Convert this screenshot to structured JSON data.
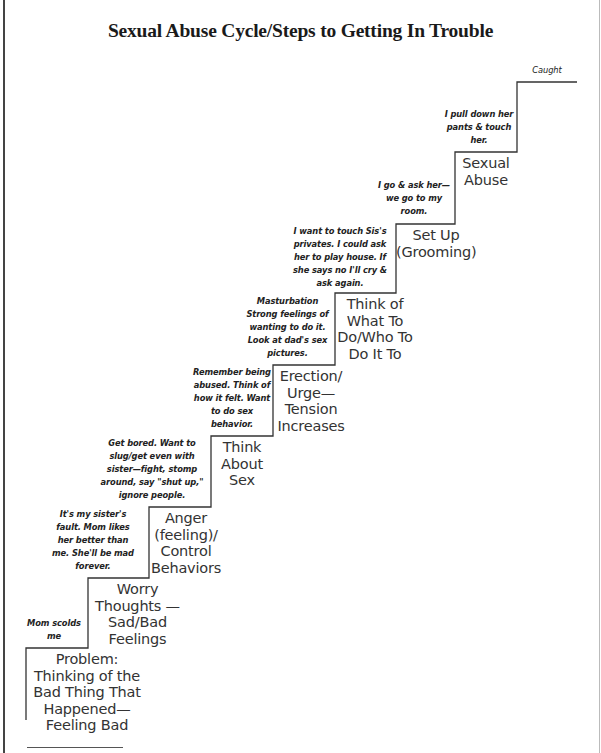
{
  "title": "Sexual Abuse Cycle/Steps to Getting In Trouble",
  "steps": [
    {
      "label_lines": [
        "Problem:",
        "Thinking of the",
        "Bad Thing That",
        "Happened—",
        "Feeling Bad"
      ],
      "note_lines": [
        "Mom scolds",
        "me"
      ]
    },
    {
      "label_lines": [
        "Worry",
        "Thoughts —",
        "Sad/Bad",
        "Feelings"
      ],
      "note_lines": [
        "It's my sister's",
        "fault. Mom likes",
        "her better than",
        "me. She'll be mad",
        "forever."
      ]
    },
    {
      "label_lines": [
        "Anger",
        "(feeling)/",
        "Control",
        "Behaviors"
      ],
      "note_lines": [
        "Get bored. Want to",
        "slug/get even with",
        "sister—fight, stomp",
        "around, say \"shut up,\"",
        "ignore people."
      ]
    },
    {
      "label_lines": [
        "Think",
        "About",
        "Sex"
      ],
      "note_lines": [
        "Remember being",
        "abused. Think of",
        "how it felt. Want",
        "to do sex",
        "behavior."
      ]
    },
    {
      "label_lines": [
        "Erection/",
        "Urge—",
        "Tension",
        "Increases"
      ],
      "note_lines": [
        "Masturbation",
        "Strong feelings of",
        "wanting to do it.",
        "Look at dad's sex",
        "pictures."
      ]
    },
    {
      "label_lines": [
        "Think of",
        "What To",
        "Do/Who To",
        "Do It To"
      ],
      "note_lines": [
        "I want to touch Sis's",
        "privates. I could ask",
        "her to play house. If",
        "she says no I'll cry &",
        "ask again."
      ]
    },
    {
      "label_lines": [
        "Set Up",
        "(Grooming)"
      ],
      "note_lines": [
        "I go & ask her—",
        "we go to my",
        "room."
      ]
    },
    {
      "label_lines": [
        "Sexual",
        "Abuse"
      ],
      "note_lines": [
        "I pull down her",
        "pants & touch",
        "her."
      ]
    },
    {
      "label_lines": [],
      "note_lines": [
        "Caught"
      ]
    }
  ],
  "colors": {
    "line": "#333333",
    "text": "#222222"
  }
}
